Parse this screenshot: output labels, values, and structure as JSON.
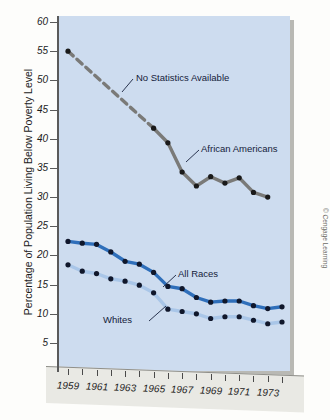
{
  "chart_data": {
    "type": "line",
    "title": "",
    "xlabel": "",
    "ylabel": "Percentage of Population Living Below Poverty Level",
    "xlim": [
      1958.4,
      1974.6
    ],
    "ylim": [
      2.5,
      61.5
    ],
    "yticks": [
      5,
      10,
      15,
      20,
      25,
      30,
      35,
      40,
      45,
      50,
      55,
      60
    ],
    "xticks": [
      1959,
      1960,
      1961,
      1962,
      1963,
      1964,
      1965,
      1966,
      1967,
      1968,
      1969,
      1970,
      1971,
      1972,
      1973,
      1974
    ],
    "xtick_labels": [
      "1959",
      "",
      "1961",
      "",
      "1963",
      "",
      "1965",
      "",
      "1967",
      "",
      "1969",
      "",
      "1971",
      "",
      "1973",
      ""
    ],
    "grid": false,
    "legend": "inline-annotations",
    "x": [
      1959,
      1960,
      1961,
      1962,
      1963,
      1964,
      1965,
      1966,
      1967,
      1968,
      1969,
      1970,
      1971,
      1972,
      1973,
      1974
    ],
    "series": [
      {
        "name": "African Americans",
        "color": "#7a7a78",
        "marker_color": "#1a1a1a",
        "style": "solid-with-dashed-gap",
        "dashed_from": 1959,
        "dashed_to": 1965,
        "values": [
          55.0,
          null,
          null,
          null,
          null,
          null,
          41.8,
          39.3,
          34.3,
          31.9,
          33.5,
          32.4,
          33.3,
          30.8,
          30.0,
          null
        ]
      },
      {
        "name": "All Races",
        "color": "#2f6fba",
        "marker_color": "#10172b",
        "style": "solid",
        "values": [
          22.4,
          22.1,
          21.9,
          20.6,
          19.0,
          18.5,
          17.1,
          14.7,
          14.3,
          12.8,
          12.0,
          12.2,
          12.2,
          11.4,
          10.9,
          11.2
        ]
      },
      {
        "name": "Whites",
        "color": "#a9c6e8",
        "marker_color": "#10172b",
        "style": "solid",
        "values": [
          18.4,
          17.3,
          16.9,
          16.0,
          15.6,
          14.9,
          13.6,
          10.8,
          10.4,
          10.0,
          9.2,
          9.5,
          9.5,
          8.9,
          8.3,
          8.6
        ]
      }
    ],
    "annotations": [
      {
        "id": "no-stats",
        "text": "No Statistics Available"
      },
      {
        "id": "african-americans",
        "text": "African Americans"
      },
      {
        "id": "all-races",
        "text": "All Races"
      },
      {
        "id": "whites",
        "text": "Whites"
      }
    ],
    "colors": {
      "panel": "#cddcef",
      "african_americans": "#7a7a78",
      "all_races": "#2f6fba",
      "whites": "#a9c6e8"
    }
  },
  "credit": {
    "text": "© Cengage Learning"
  }
}
